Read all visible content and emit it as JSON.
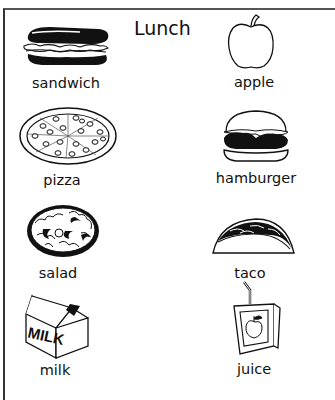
{
  "worksheet": {
    "title": "Lunch",
    "items": [
      {
        "label": "sandwich",
        "icon": "sandwich-icon"
      },
      {
        "label": "apple",
        "icon": "apple-icon"
      },
      {
        "label": "pizza",
        "icon": "pizza-icon"
      },
      {
        "label": "hamburger",
        "icon": "hamburger-icon"
      },
      {
        "label": "salad",
        "icon": "salad-icon"
      },
      {
        "label": "taco",
        "icon": "taco-icon"
      },
      {
        "label": "milk",
        "icon": "milk-carton-icon",
        "carton_text": "MILK"
      },
      {
        "label": "juice",
        "icon": "juice-box-icon"
      }
    ]
  }
}
